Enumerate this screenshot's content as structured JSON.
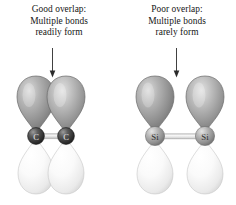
{
  "figure": {
    "background_color": "#ffffff"
  },
  "panels": [
    {
      "id": "carbon",
      "caption": {
        "line1": "Good overlap:",
        "line2": "Multiple bonds",
        "line3": "readily form"
      },
      "arrow": {
        "name": "down-arrow",
        "points_to": "orbital overlap region"
      },
      "atoms": [
        {
          "label": "C",
          "color": "#3a3a3a"
        },
        {
          "label": "C",
          "color": "#3a3a3a"
        }
      ],
      "bond": {
        "color": "#d8d8d8"
      },
      "lobes": {
        "top_color": "#8d8d8d",
        "bottom_color": "#f2f2f2",
        "overlap": "touching"
      }
    },
    {
      "id": "silicon",
      "caption": {
        "line1": "Poor overlap:",
        "line2": "Multiple bonds",
        "line3": "rarely form"
      },
      "arrow": {
        "name": "down-arrow",
        "points_to": "gap between orbitals"
      },
      "atoms": [
        {
          "label": "Si",
          "color": "#9a9a9a"
        },
        {
          "label": "Si",
          "color": "#9a9a9a"
        }
      ],
      "bond": {
        "color": "#dcdcdc"
      },
      "lobes": {
        "top_color": "#8d8d8d",
        "bottom_color": "#f2f2f2",
        "overlap": "separated"
      }
    }
  ],
  "colors": {
    "text": "#161616",
    "arrow": "#2b2b2b",
    "lobe_top_dark": "#7c7c7c",
    "lobe_top_light": "#c9c9c9",
    "lobe_bottom_dark": "#dcdcdc",
    "lobe_bottom_light": "#fbfbfb",
    "carbon_sphere": "#3a3a3a",
    "silicon_sphere": "#9a9a9a",
    "outline": "#6f6f6f"
  }
}
